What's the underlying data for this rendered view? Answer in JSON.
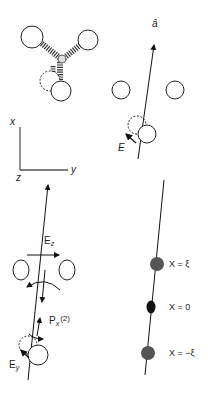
{
  "panels": {
    "molecule": {
      "description": "Trigonal molecule with three outer atoms connected by springs to central atom; dashed displaced atom"
    },
    "axis_vector": {
      "label": "â",
      "field_label": "E"
    },
    "coordinate_axes": {
      "x_label": "x",
      "y_label": "y",
      "z_label": "z"
    },
    "field_diagram": {
      "ez_label": "E",
      "ez_sub": "z",
      "ey_label": "E",
      "ey_sub": "y",
      "px_label": "P",
      "px_sub": "x",
      "px_sup": "(2)"
    },
    "positions": {
      "points": [
        {
          "label": "X = ξ",
          "color": "#555555"
        },
        {
          "label": "X = 0",
          "color": "#111111"
        },
        {
          "label": "X = −ξ",
          "color": "#555555"
        }
      ]
    }
  }
}
